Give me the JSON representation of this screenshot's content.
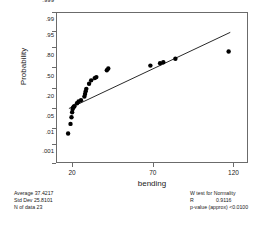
{
  "chart_data": {
    "type": "scatter",
    "title": "",
    "xlabel": "bending",
    "ylabel": "Probability",
    "xlim": [
      10,
      129
    ],
    "ylim_probability": [
      0.001,
      0.999
    ],
    "grid": false,
    "legend": "none",
    "x_ticks": [
      {
        "value": 20,
        "label": "20"
      },
      {
        "value": 70,
        "label": "70"
      },
      {
        "value": 120,
        "label": "120"
      }
    ],
    "y_ticks": [
      {
        "value": 0.999,
        "label": ".999"
      },
      {
        "value": 0.99,
        "label": ".99"
      },
      {
        "value": 0.95,
        "label": ".95"
      },
      {
        "value": 0.8,
        "label": ".80"
      },
      {
        "value": 0.5,
        "label": ".50"
      },
      {
        "value": 0.2,
        "label": ".20"
      },
      {
        "value": 0.05,
        "label": ".05"
      },
      {
        "value": 0.01,
        "label": ".01"
      },
      {
        "value": 0.001,
        "label": ".001"
      }
    ],
    "points": [
      {
        "x": 17.5,
        "y": 0.03
      },
      {
        "x": 19.0,
        "y": 0.068
      },
      {
        "x": 19.6,
        "y": 0.112
      },
      {
        "x": 20.0,
        "y": 0.155
      },
      {
        "x": 20.3,
        "y": 0.19
      },
      {
        "x": 20.6,
        "y": 0.205
      },
      {
        "x": 21.0,
        "y": 0.215
      },
      {
        "x": 21.4,
        "y": 0.222
      },
      {
        "x": 23.0,
        "y": 0.26
      },
      {
        "x": 24.0,
        "y": 0.285
      },
      {
        "x": 25.5,
        "y": 0.3
      },
      {
        "x": 27.6,
        "y": 0.355
      },
      {
        "x": 28.0,
        "y": 0.395
      },
      {
        "x": 28.4,
        "y": 0.44
      },
      {
        "x": 28.8,
        "y": 0.478
      },
      {
        "x": 30.5,
        "y": 0.56
      },
      {
        "x": 31.8,
        "y": 0.615
      },
      {
        "x": 34.0,
        "y": 0.65
      },
      {
        "x": 35.0,
        "y": 0.665
      },
      {
        "x": 41.5,
        "y": 0.76
      },
      {
        "x": 42.4,
        "y": 0.782
      },
      {
        "x": 68.5,
        "y": 0.815
      },
      {
        "x": 74.5,
        "y": 0.84
      },
      {
        "x": 76.5,
        "y": 0.85
      },
      {
        "x": 84.0,
        "y": 0.88
      },
      {
        "x": 117.0,
        "y": 0.93
      }
    ],
    "fit_line": {
      "type": "normal-reference-line",
      "x_start": 18.0,
      "y_start": 0.195,
      "x_end": 118.0,
      "y_end": 0.988
    }
  },
  "axes": {
    "y_title": "Probability",
    "x_title": "bending"
  },
  "stats_left": {
    "rows": [
      {
        "label": "Average",
        "value": "37.4217"
      },
      {
        "label": "Std Dev",
        "value": "25.8101"
      },
      {
        "label": "N of data",
        "value": "23"
      }
    ],
    "line1": "Average  37.4217",
    "line2": "Std Dev  25.8101",
    "line3": "N of data  23"
  },
  "stats_right": {
    "heading": "W test for Normality",
    "r_label": "R",
    "r_value": "0.9116",
    "p_label": "p-value (approx)",
    "p_value": "<0.0100"
  }
}
